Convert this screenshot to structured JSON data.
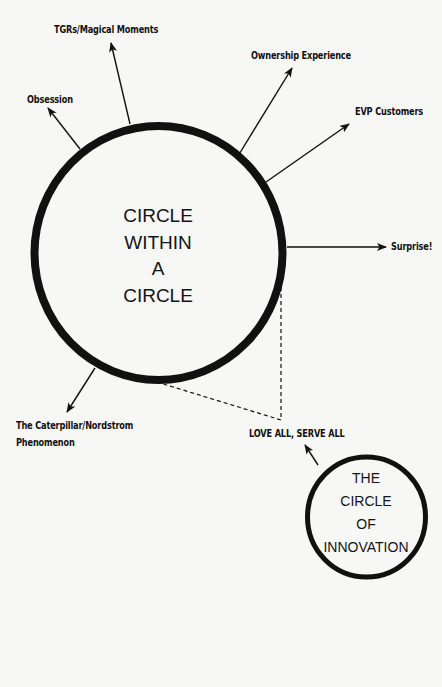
{
  "diagram": {
    "main_circle": {
      "lines": [
        "CIRCLE",
        "WITHIN",
        "A",
        "CIRCLE"
      ]
    },
    "innovation_circle": {
      "lines": [
        "THE",
        "CIRCLE",
        "OF",
        "INNOVATION"
      ]
    },
    "labels": {
      "tgrs": "TGRs/Magical Moments",
      "ownership": "Ownership Experience",
      "obsession": "Obsession",
      "evp": "EVP Customers",
      "surprise": "Surprise!",
      "caterpillar_line1": "The Caterpillar/Nordstrom",
      "caterpillar_line2": "Phenomenon",
      "love_all": "LOVE ALL, SERVE ALL"
    },
    "colors": {
      "ink": "#111111",
      "paper": "#f7f7f5"
    }
  }
}
